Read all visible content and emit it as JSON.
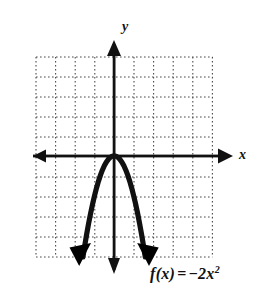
{
  "figure": {
    "type": "cartesian-graph",
    "background": "#ffffff",
    "ink_color": "#111111",
    "grid_color": "#555555",
    "function_label": {
      "prefix": "f",
      "argument": "(x)",
      "equals": "=",
      "minus": "−",
      "coefficient": "2",
      "variable": "x",
      "exponent": "2",
      "full_text": "f(x) = −2x²"
    },
    "axis_labels": {
      "x": "x",
      "y": "y"
    }
  },
  "chart_data": {
    "type": "line",
    "title": "",
    "subtitle": "",
    "xlabel": "x",
    "ylabel": "y",
    "equation": "f(x) = -2x^2",
    "coefficient_a": -2,
    "coefficient_b": 0,
    "coefficient_c": 0,
    "vertex": [
      0,
      0
    ],
    "opens": "down",
    "grid": true,
    "grid_style": "dotted",
    "grid_step_x": 1,
    "grid_step_y": 1,
    "xlim": [
      -3.9,
      5.05
    ],
    "ylim": [
      -5.05,
      4.95
    ],
    "axis_arrows": [
      "left",
      "right",
      "up",
      "down"
    ],
    "curve_arrows": [
      "down-left",
      "down-right"
    ],
    "legend": null,
    "legend_position": null,
    "tick_labels_x": [],
    "tick_labels_y": [],
    "annotations": [
      {
        "text": "f(x) = −2x²",
        "x": 2.0,
        "y": -5.7
      },
      {
        "text": "y",
        "x": 0.35,
        "y": 6.2
      },
      {
        "text": "x",
        "x": 6.0,
        "y": 0.1
      }
    ],
    "series": [
      {
        "name": "f(x) = -2x^2",
        "x": [
          -1.59,
          -1.5,
          -1.4,
          -1.3,
          -1.2,
          -1.1,
          -1.0,
          -0.9,
          -0.8,
          -0.7,
          -0.6,
          -0.5,
          -0.4,
          -0.3,
          -0.2,
          -0.1,
          0.0,
          0.1,
          0.2,
          0.3,
          0.4,
          0.5,
          0.6,
          0.7,
          0.8,
          0.9,
          1.0,
          1.1,
          1.2,
          1.3,
          1.4,
          1.5,
          1.59
        ],
        "y": [
          -5.06,
          -4.5,
          -3.92,
          -3.38,
          -2.88,
          -2.42,
          -2.0,
          -1.62,
          -1.28,
          -0.98,
          -0.72,
          -0.5,
          -0.32,
          -0.18,
          -0.08,
          -0.02,
          0.0,
          -0.02,
          -0.08,
          -0.18,
          -0.32,
          -0.5,
          -0.72,
          -0.98,
          -1.28,
          -1.62,
          -2.0,
          -2.42,
          -2.88,
          -3.38,
          -3.92,
          -4.5,
          -5.06
        ]
      }
    ]
  }
}
